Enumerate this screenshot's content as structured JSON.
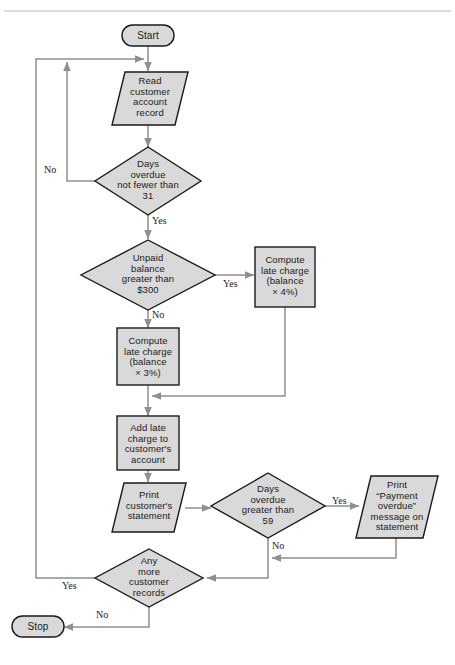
{
  "diagram": {
    "colors": {
      "shape_fill": "#d9d9d9",
      "shape_stroke": "#1a1a1a",
      "connector": "#8f8f8f",
      "background": "#ffffff",
      "rule": "#b9b9b9"
    },
    "nodes": {
      "start": {
        "label": "Start",
        "type": "terminator"
      },
      "read_record": {
        "label": "Read\ncustomer\naccount\nrecord",
        "type": "input-output"
      },
      "days_overdue_31": {
        "label": "Days\noverdue\nnot fewer than\n31",
        "type": "decision"
      },
      "unpaid_balance": {
        "label": "Unpaid\nbalance\ngreater than\n$300",
        "type": "decision"
      },
      "late_charge_4": {
        "label": "Compute\nlate charge\n(balance\n× 4%)",
        "type": "process"
      },
      "late_charge_3": {
        "label": "Compute\nlate charge\n(balance\n× 3%)",
        "type": "process"
      },
      "add_charge": {
        "label": "Add late\ncharge to\ncustomer's\naccount",
        "type": "process"
      },
      "print_statement": {
        "label": "Print\ncustomer's\nstatement",
        "type": "input-output"
      },
      "days_overdue_59": {
        "label": "Days\noverdue\ngreater than\n59",
        "type": "decision"
      },
      "print_overdue": {
        "label": "Print\n“Payment\noverdue”\nmessage on\nstatement",
        "type": "input-output"
      },
      "any_more": {
        "label": "Any\nmore\ncustomer\nrecords",
        "type": "decision"
      },
      "stop": {
        "label": "Stop",
        "type": "terminator"
      }
    },
    "edge_labels": {
      "days31_no": "No",
      "days31_yes": "Yes",
      "unpaid_yes": "Yes",
      "unpaid_no": "No",
      "days59_yes": "Yes",
      "days59_no": "No",
      "anymore_yes": "Yes",
      "anymore_no": "No"
    }
  }
}
